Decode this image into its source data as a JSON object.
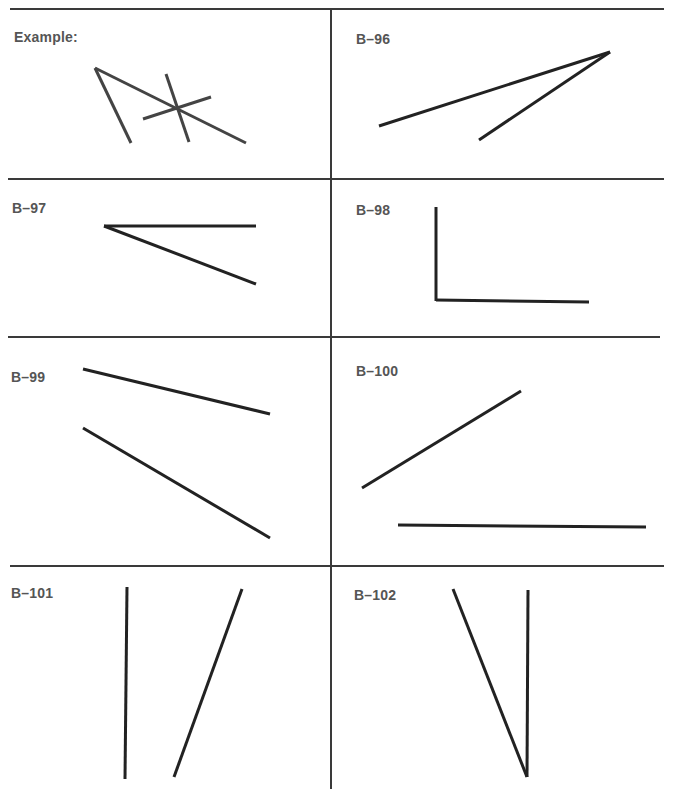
{
  "colors": {
    "grid": "#3a3a3a",
    "label": "#555555",
    "line": "#222222",
    "background": "#ffffff"
  },
  "cells": [
    {
      "id": "example",
      "label": "Example:",
      "lines": [
        {
          "x1": 95,
          "y1": 68,
          "x2": 131,
          "y2": 143
        },
        {
          "x1": 95,
          "y1": 68,
          "x2": 246,
          "y2": 143
        },
        {
          "x1": 166,
          "y1": 74,
          "x2": 189,
          "y2": 142
        },
        {
          "x1": 143,
          "y1": 119,
          "x2": 211,
          "y2": 97
        }
      ]
    },
    {
      "id": "b-96",
      "label": "B–96",
      "lines": [
        {
          "x1": 379,
          "y1": 126,
          "x2": 610,
          "y2": 52
        },
        {
          "x1": 479,
          "y1": 140,
          "x2": 610,
          "y2": 52
        }
      ]
    },
    {
      "id": "b-97",
      "label": "B–97",
      "lines": [
        {
          "x1": 104,
          "y1": 226,
          "x2": 256,
          "y2": 226
        },
        {
          "x1": 104,
          "y1": 226,
          "x2": 256,
          "y2": 284
        }
      ]
    },
    {
      "id": "b-98",
      "label": "B–98",
      "lines": [
        {
          "x1": 436,
          "y1": 207,
          "x2": 436,
          "y2": 301
        },
        {
          "x1": 436,
          "y1": 300,
          "x2": 589,
          "y2": 302
        }
      ]
    },
    {
      "id": "b-99",
      "label": "B–99",
      "lines": [
        {
          "x1": 83,
          "y1": 369,
          "x2": 270,
          "y2": 414
        },
        {
          "x1": 83,
          "y1": 428,
          "x2": 270,
          "y2": 538
        }
      ]
    },
    {
      "id": "b-100",
      "label": "B–100",
      "lines": [
        {
          "x1": 362,
          "y1": 488,
          "x2": 521,
          "y2": 391
        },
        {
          "x1": 398,
          "y1": 525,
          "x2": 646,
          "y2": 527
        }
      ]
    },
    {
      "id": "b-101",
      "label": "B–101",
      "lines": [
        {
          "x1": 127,
          "y1": 587,
          "x2": 125,
          "y2": 779
        },
        {
          "x1": 242,
          "y1": 589,
          "x2": 174,
          "y2": 777
        }
      ]
    },
    {
      "id": "b-102",
      "label": "B–102",
      "lines": [
        {
          "x1": 453,
          "y1": 589,
          "x2": 527,
          "y2": 777
        },
        {
          "x1": 528,
          "y1": 590,
          "x2": 527,
          "y2": 777
        }
      ]
    }
  ]
}
